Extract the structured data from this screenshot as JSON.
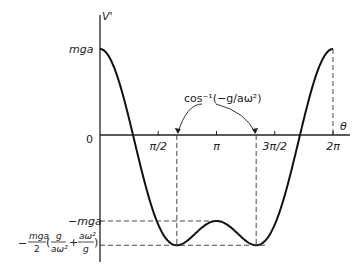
{
  "chart_data": {
    "type": "line",
    "title": "",
    "xlabel": "θ",
    "ylabel": "V'",
    "xlim": [
      0,
      6.2832
    ],
    "ylim_units_mga": [
      -1.28,
      1.0
    ],
    "x_ticks": [
      {
        "value": 0,
        "label": "0"
      },
      {
        "value": 1.5708,
        "label": "π/2"
      },
      {
        "value": 3.1416,
        "label": "π"
      },
      {
        "value": 4.7124,
        "label": "3π/2"
      },
      {
        "value": 6.2832,
        "label": "2π"
      }
    ],
    "y_ticks": [
      {
        "value": 1.0,
        "label": "mga"
      },
      {
        "value": -1.0,
        "label": "-mga"
      },
      {
        "value": -1.28,
        "label": "-(mga/2)(g/aω² + aω²/g)"
      }
    ],
    "parameter_g_over_a_omega2": 0.48,
    "series": [
      {
        "name": "V'(θ)",
        "formula": "mga[cosθ + (aω²/2g)(cos²θ − 1)]",
        "key_points": [
          {
            "theta": 0,
            "value_mga": 1.0
          },
          {
            "theta": 2.071,
            "value_mga": -1.28
          },
          {
            "theta": 3.1416,
            "value_mga": -1.0
          },
          {
            "theta": 4.212,
            "value_mga": -1.28
          },
          {
            "theta": 6.2832,
            "value_mga": 1.0
          }
        ]
      }
    ],
    "annotations": [
      {
        "text": "cos⁻¹(−g/aω²)",
        "meaning": "θ at the minima"
      }
    ],
    "grid": false
  },
  "labels": {
    "ylabel": "V'",
    "xlabel": "θ",
    "origin": "0",
    "mga": "mga",
    "neg_mga": "−mga",
    "annot": "cos⁻¹(−g/aω²)",
    "min_prefix": "−",
    "min_frac_num": "mga",
    "min_frac_den": "2",
    "min_t1_num": "g",
    "min_t1_den": "aω²",
    "min_plus": "+",
    "min_t2_num": "aω²",
    "min_t2_den": "g"
  }
}
